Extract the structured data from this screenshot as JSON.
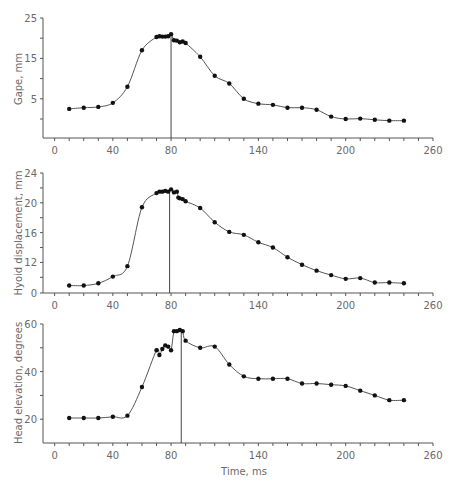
{
  "chart_data": [
    {
      "type": "line",
      "title": "",
      "xlabel": "",
      "ylabel": "Gape, mm",
      "xlim": [
        -8,
        260
      ],
      "ylim": [
        -4.7,
        25
      ],
      "x_ticks": [
        0,
        40,
        80,
        140,
        200,
        260
      ],
      "y_ticks": [
        5,
        15,
        25
      ],
      "y_minor_ticks": [
        0,
        10,
        20
      ],
      "vertical_marker_x": 80,
      "series": [
        {
          "name": "Gape",
          "x": [
            10,
            20,
            30,
            40,
            50,
            60,
            70,
            72,
            74,
            76,
            78,
            80,
            82,
            84,
            86,
            88,
            90,
            100,
            110,
            120,
            130,
            140,
            150,
            160,
            170,
            180,
            190,
            200,
            210,
            220,
            230,
            240
          ],
          "y": [
            2.5,
            2.8,
            3.0,
            4.0,
            8.0,
            17.0,
            20.3,
            20.5,
            20.4,
            20.4,
            20.5,
            21.0,
            19.5,
            19.4,
            19.0,
            19.2,
            18.8,
            15.4,
            10.7,
            8.8,
            5.0,
            3.8,
            3.5,
            2.8,
            2.8,
            2.3,
            0.6,
            0.0,
            0.1,
            -0.2,
            -0.4,
            -0.4
          ]
        }
      ]
    },
    {
      "type": "line",
      "title": "",
      "xlabel": "",
      "ylabel": "Hyoid displacement, mm",
      "xlim": [
        -8,
        260
      ],
      "ylim": [
        7.9,
        24
      ],
      "axis_break": true,
      "x_ticks": [
        0,
        40,
        80,
        140,
        200,
        260
      ],
      "y_ticks": [
        {
          "value": 7.9,
          "label": "0"
        },
        {
          "value": 12,
          "label": "12"
        },
        {
          "value": 16,
          "label": "16"
        },
        {
          "value": 20,
          "label": "20"
        },
        {
          "value": 24,
          "label": "24"
        }
      ],
      "y_minor_ticks": [
        10,
        14,
        18,
        22
      ],
      "vertical_marker_x": 79,
      "series": [
        {
          "name": "Hyoid displacement",
          "x": [
            10,
            20,
            30,
            40,
            50,
            60,
            70,
            72,
            74,
            76,
            78,
            80,
            82,
            84,
            85,
            86,
            88,
            90,
            100,
            110,
            120,
            130,
            140,
            150,
            160,
            170,
            180,
            190,
            200,
            210,
            220,
            230,
            240
          ],
          "y": [
            8.9,
            8.9,
            9.2,
            10.1,
            11.5,
            19.4,
            21.3,
            21.5,
            21.5,
            21.6,
            21.5,
            21.8,
            21.4,
            21.5,
            20.7,
            20.6,
            20.5,
            20.2,
            19.3,
            17.4,
            16.1,
            15.7,
            14.7,
            14.0,
            12.7,
            11.7,
            10.9,
            10.3,
            9.8,
            9.9,
            9.3,
            9.3,
            9.2
          ]
        }
      ]
    },
    {
      "type": "line",
      "title": "",
      "xlabel": "Time, ms",
      "ylabel": "Head elevation, degrees",
      "xlim": [
        -8,
        260
      ],
      "ylim": [
        10,
        60
      ],
      "x_ticks": [
        0,
        40,
        80,
        140,
        200,
        260
      ],
      "y_ticks": [
        20,
        40,
        60
      ],
      "y_minor_ticks": [
        30,
        50
      ],
      "vertical_marker_x": 87,
      "series": [
        {
          "name": "Head elevation",
          "x": [
            10,
            20,
            30,
            40,
            50,
            60,
            70,
            72,
            74,
            76,
            78,
            80,
            82,
            84,
            86,
            88,
            90,
            100,
            110,
            120,
            130,
            140,
            150,
            160,
            170,
            180,
            190,
            200,
            210,
            220,
            230,
            240
          ],
          "y": [
            20.5,
            20.5,
            20.5,
            21.0,
            21.5,
            33.5,
            49.0,
            47.0,
            49.5,
            51.0,
            50.5,
            49.0,
            57.0,
            57.0,
            57.5,
            57.0,
            53.0,
            50.0,
            50.5,
            43.0,
            38.0,
            37.0,
            37.0,
            37.0,
            35.0,
            35.0,
            34.5,
            34.0,
            32.0,
            30.0,
            28.0,
            28.0
          ]
        }
      ]
    }
  ],
  "labels": {
    "gape_ylabel": "Gape, mm",
    "hyoid_ylabel": "Hyoid displacement, mm",
    "head_ylabel": "Head elevation, degrees",
    "time_xlabel": "Time, ms"
  }
}
